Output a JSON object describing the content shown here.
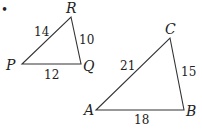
{
  "bullet": "•",
  "triangles": [
    {
      "name": "PQR",
      "vertices": [
        {
          "label": "P",
          "x": 22,
          "y": 64
        },
        {
          "label": "Q",
          "x": 81,
          "y": 64
        },
        {
          "label": "R",
          "x": 71,
          "y": 17
        }
      ],
      "sides": [
        {
          "between": "PR",
          "length": "14"
        },
        {
          "between": "RQ",
          "length": "10"
        },
        {
          "between": "PQ",
          "length": "12"
        }
      ]
    },
    {
      "name": "ABC",
      "vertices": [
        {
          "label": "A",
          "x": 96,
          "y": 110
        },
        {
          "label": "B",
          "x": 184,
          "y": 110
        },
        {
          "label": "C",
          "x": 170,
          "y": 38
        }
      ],
      "sides": [
        {
          "between": "AC",
          "length": "21"
        },
        {
          "between": "CB",
          "length": "15"
        },
        {
          "between": "AB",
          "length": "18"
        }
      ]
    }
  ]
}
